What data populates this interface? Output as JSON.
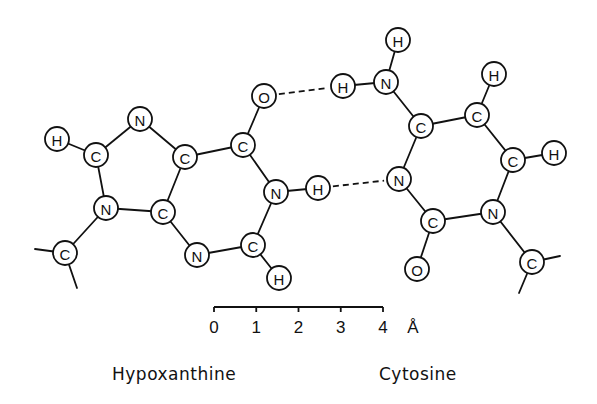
{
  "diagram": {
    "atom_radius": 12,
    "atoms": [
      {
        "id": "hx_H8",
        "el": "H",
        "x": 57,
        "y": 139
      },
      {
        "id": "hx_C8",
        "el": "C",
        "x": 96,
        "y": 155
      },
      {
        "id": "hx_N7",
        "el": "N",
        "x": 140,
        "y": 119
      },
      {
        "id": "hx_C5",
        "el": "C",
        "x": 185,
        "y": 157
      },
      {
        "id": "hx_C6",
        "el": "C",
        "x": 243,
        "y": 145
      },
      {
        "id": "hx_O6",
        "el": "O",
        "x": 264,
        "y": 96
      },
      {
        "id": "hx_N9",
        "el": "N",
        "x": 106,
        "y": 208
      },
      {
        "id": "hx_C4",
        "el": "C",
        "x": 163,
        "y": 212
      },
      {
        "id": "hx_N3",
        "el": "N",
        "x": 197,
        "y": 255
      },
      {
        "id": "hx_C2",
        "el": "C",
        "x": 253,
        "y": 245
      },
      {
        "id": "hx_H2",
        "el": "H",
        "x": 279,
        "y": 278
      },
      {
        "id": "hx_N1",
        "el": "N",
        "x": 276,
        "y": 192
      },
      {
        "id": "hx_H1",
        "el": "H",
        "x": 318,
        "y": 188
      },
      {
        "id": "hx_C1p",
        "el": "C",
        "x": 65,
        "y": 253
      },
      {
        "id": "cy_H4a",
        "el": "H",
        "x": 343,
        "y": 86
      },
      {
        "id": "cy_N4",
        "el": "N",
        "x": 386,
        "y": 82
      },
      {
        "id": "cy_H4b",
        "el": "H",
        "x": 398,
        "y": 40
      },
      {
        "id": "cy_C4",
        "el": "C",
        "x": 421,
        "y": 126
      },
      {
        "id": "cy_C5",
        "el": "C",
        "x": 477,
        "y": 115
      },
      {
        "id": "cy_H5",
        "el": "H",
        "x": 494,
        "y": 74
      },
      {
        "id": "cy_C6",
        "el": "C",
        "x": 513,
        "y": 160
      },
      {
        "id": "cy_H6",
        "el": "H",
        "x": 554,
        "y": 153
      },
      {
        "id": "cy_N3",
        "el": "N",
        "x": 399,
        "y": 179
      },
      {
        "id": "cy_C2",
        "el": "C",
        "x": 433,
        "y": 221
      },
      {
        "id": "cy_N1",
        "el": "N",
        "x": 493,
        "y": 212
      },
      {
        "id": "cy_O2",
        "el": "O",
        "x": 417,
        "y": 269
      },
      {
        "id": "cy_C1p",
        "el": "C",
        "x": 532,
        "y": 262
      }
    ],
    "bonds": [
      [
        "hx_H8",
        "hx_C8"
      ],
      [
        "hx_C8",
        "hx_N7"
      ],
      [
        "hx_N7",
        "hx_C5"
      ],
      [
        "hx_C5",
        "hx_C6"
      ],
      [
        "hx_C6",
        "hx_O6"
      ],
      [
        "hx_C6",
        "hx_N1"
      ],
      [
        "hx_N1",
        "hx_C2"
      ],
      [
        "hx_C2",
        "hx_H2"
      ],
      [
        "hx_C2",
        "hx_N3"
      ],
      [
        "hx_N3",
        "hx_C4"
      ],
      [
        "hx_C4",
        "hx_C5"
      ],
      [
        "hx_C4",
        "hx_N9"
      ],
      [
        "hx_N9",
        "hx_C8"
      ],
      [
        "hx_N9",
        "hx_C1p"
      ],
      [
        "hx_N1",
        "hx_H1"
      ],
      [
        "cy_H4a",
        "cy_N4"
      ],
      [
        "cy_N4",
        "cy_H4b"
      ],
      [
        "cy_N4",
        "cy_C4"
      ],
      [
        "cy_C4",
        "cy_C5"
      ],
      [
        "cy_C5",
        "cy_H5"
      ],
      [
        "cy_C5",
        "cy_C6"
      ],
      [
        "cy_C6",
        "cy_H6"
      ],
      [
        "cy_C6",
        "cy_N1"
      ],
      [
        "cy_N1",
        "cy_C2"
      ],
      [
        "cy_C2",
        "cy_N3"
      ],
      [
        "cy_N3",
        "cy_C4"
      ],
      [
        "cy_C2",
        "cy_O2"
      ],
      [
        "cy_N1",
        "cy_C1p"
      ]
    ],
    "stubs": [
      {
        "x1": 65,
        "y1": 253,
        "x2": 35,
        "y2": 249
      },
      {
        "x1": 65,
        "y1": 253,
        "x2": 77,
        "y2": 288
      },
      {
        "x1": 532,
        "y1": 262,
        "x2": 560,
        "y2": 256
      },
      {
        "x1": 532,
        "y1": 262,
        "x2": 519,
        "y2": 293
      }
    ],
    "hydrogen_bonds": [
      [
        "hx_O6",
        "cy_H4a"
      ],
      [
        "hx_H1",
        "cy_N3"
      ]
    ],
    "scale_bar": {
      "x_start": 214,
      "x_end": 383,
      "y": 307,
      "ticks": [
        "0",
        "1",
        "2",
        "3",
        "4"
      ],
      "unit": "Å"
    },
    "labels": {
      "left_molecule": "Hypoxanthine",
      "right_molecule": "Cytosine"
    }
  }
}
